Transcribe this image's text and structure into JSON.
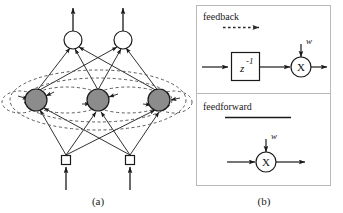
{
  "figure": {
    "panels": [
      {
        "id": "a",
        "caption": "(a)",
        "title": "recurrent-neural-network-architecture",
        "layers": [
          {
            "name": "output-layer",
            "node_shape": "circle",
            "node_fill": "#ffffff",
            "count": 2,
            "nodes": [
              {
                "cx": 73,
                "cy": 40,
                "r": 9
              },
              {
                "cx": 123,
                "cy": 40,
                "r": 9
              }
            ]
          },
          {
            "name": "hidden-layer",
            "node_shape": "circle",
            "node_fill": "#8c8c8c",
            "count": 3,
            "nodes": [
              {
                "cx": 36,
                "cy": 100,
                "r": 11
              },
              {
                "cx": 98,
                "cy": 100,
                "r": 11
              },
              {
                "cx": 159,
                "cy": 100,
                "r": 11
              }
            ]
          },
          {
            "name": "input-layer",
            "node_shape": "square",
            "node_fill": "#ffffff",
            "count": 2,
            "nodes": [
              {
                "cx": 66,
                "cy": 160,
                "size": 9
              },
              {
                "cx": 130,
                "cy": 160,
                "size": 9
              }
            ]
          }
        ],
        "recurrent_loops": {
          "style": "dashed",
          "color": "#5a5a5a",
          "count": 6
        }
      },
      {
        "id": "b",
        "caption": "(b)",
        "title": "connection-types",
        "sections": [
          {
            "name": "feedback",
            "label": "feedback",
            "underline_style": "dashed-arrow",
            "blocks": [
              {
                "type": "delay-block",
                "label": "z",
                "exponent": "-1"
              },
              {
                "type": "multiplier",
                "label": "X",
                "weight_label": "w"
              }
            ]
          },
          {
            "name": "feedforward",
            "label": "feedforward",
            "underline_style": "solid-line",
            "blocks": [
              {
                "type": "multiplier",
                "label": "X",
                "weight_label": "w"
              }
            ]
          }
        ]
      }
    ],
    "colors": {
      "line": "#1a1a1a",
      "hidden_node_fill": "#8c8c8c",
      "panel_border": "#b9b9b9",
      "dashed": "#5a5a5a",
      "background": "#ffffff"
    }
  }
}
